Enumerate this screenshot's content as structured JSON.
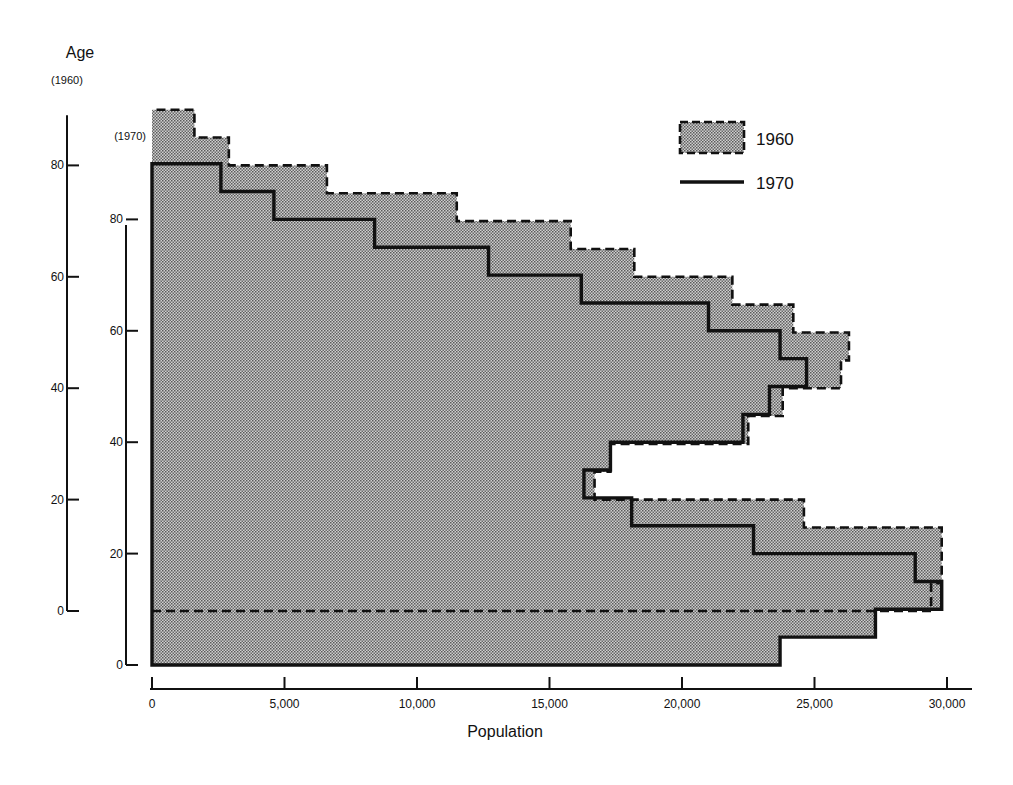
{
  "chart_data": {
    "type": "bar",
    "subtype": "step-histogram (population pyramid, one side)",
    "title": "",
    "xlabel": "Population",
    "ylabel": "Age",
    "x_ticks": [
      0,
      5000,
      10000,
      15000,
      20000,
      25000,
      30000
    ],
    "x_tick_labels": [
      "0",
      "5,000",
      "10,000",
      "15,000",
      "20,000",
      "25,000",
      "30,000"
    ],
    "xlim": [
      0,
      31000
    ],
    "y_axes": [
      {
        "label": "(1960)",
        "ticks": [
          0,
          20,
          40,
          60,
          80
        ],
        "ylim": [
          0,
          90
        ]
      },
      {
        "label": "(1970)",
        "ticks": [
          0,
          20,
          40,
          60,
          80
        ],
        "ylim": [
          0,
          80
        ],
        "offset_years": 10
      }
    ],
    "bin_width_years": 5,
    "categories": [
      "0-4",
      "5-9",
      "10-14",
      "15-19",
      "20-24",
      "25-29",
      "30-34",
      "35-39",
      "40-44",
      "45-49",
      "50-54",
      "55-59",
      "60-64",
      "65-69",
      "70-74",
      "75-79",
      "80-84",
      "85-89"
    ],
    "series": [
      {
        "name": "1960",
        "style": "dashed outline, dotted gray fill",
        "age_axis": "1960",
        "values": [
          29400,
          29800,
          29800,
          24600,
          16700,
          17300,
          22500,
          23800,
          26000,
          26300,
          24200,
          21900,
          18200,
          15800,
          11500,
          6600,
          2900,
          1600
        ]
      },
      {
        "name": "1970",
        "style": "solid thick outline",
        "age_axis": "1970",
        "values": [
          23700,
          27300,
          29800,
          28800,
          22700,
          18100,
          16300,
          17300,
          22300,
          23300,
          24700,
          23700,
          21000,
          16200,
          12700,
          8400,
          4600,
          2600
        ]
      }
    ],
    "legend": {
      "position": "top-right",
      "entries": [
        {
          "label": "1960",
          "marker": "dashed box with dotted fill"
        },
        {
          "label": "1970",
          "marker": "solid line"
        }
      ]
    },
    "grid": false
  },
  "labels": {
    "y_title": "Age",
    "y_axis_1960_caption": "(1960)",
    "y_axis_1970_caption": "(1970)",
    "x_title": "Population",
    "legend_1960": "1960",
    "legend_1970": "1970"
  },
  "colors": {
    "ink": "#111111",
    "fill_dot": "#5a5a5a",
    "fill_bg": "#d8d8d8"
  }
}
